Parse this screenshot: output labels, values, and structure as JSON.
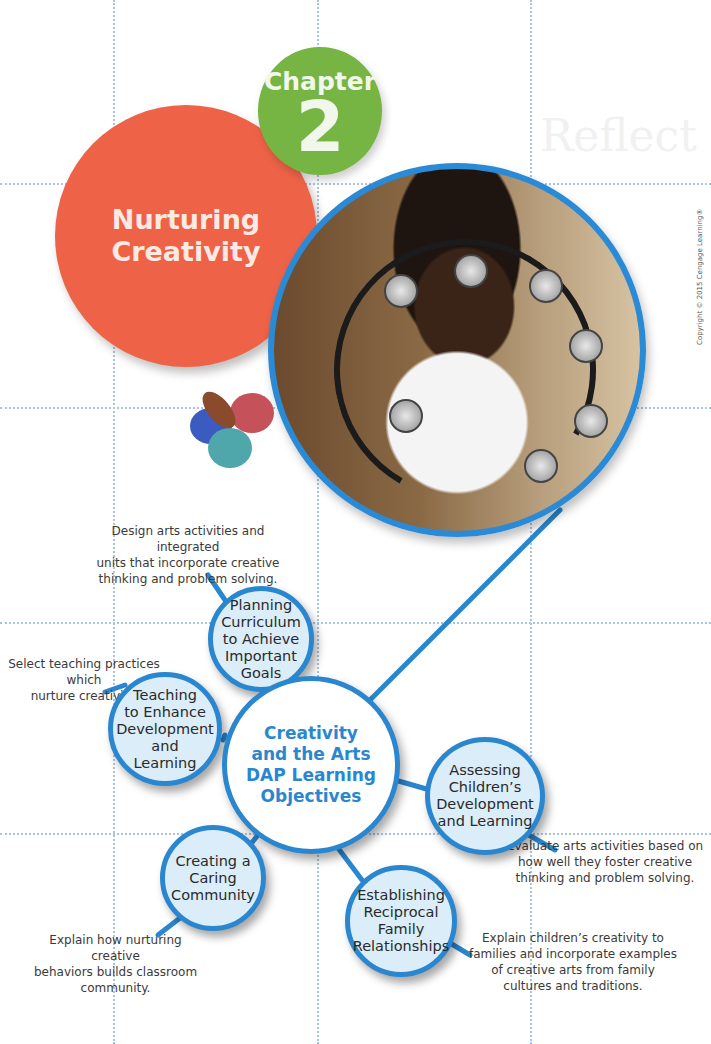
{
  "chapter": {
    "label": "Chapter",
    "number": "2",
    "title_line1": "Nurturing",
    "title_line2": "Creativity"
  },
  "photo": {
    "description": "Child holding a tambourine",
    "copyright": "Copyright © 2015 Cengage Learning®"
  },
  "background": {
    "faint_text": "Reflect"
  },
  "diagram": {
    "center": {
      "line1": "Creativity",
      "line2": "and the Arts",
      "line3": "DAP Learning",
      "line4": "Objectives"
    },
    "nodes": [
      {
        "lines": [
          "Planning",
          "Curriculum",
          "to Achieve",
          "Important",
          "Goals"
        ],
        "description": [
          "Design arts activities and integrated",
          "units that incorporate creative",
          "thinking and problem solving."
        ]
      },
      {
        "lines": [
          "Teaching",
          "to Enhance",
          "Development",
          "and",
          "Learning"
        ],
        "description": [
          "Select teaching practices which",
          "nurture creativity."
        ]
      },
      {
        "lines": [
          "Assessing",
          "Children’s",
          "Development",
          "and Learning"
        ],
        "description": [
          "Evaluate arts activities based on",
          "how well they foster creative",
          "thinking and problem solving."
        ]
      },
      {
        "lines": [
          "Creating a",
          "Caring",
          "Community"
        ],
        "description": [
          "Explain how nurturing creative",
          "behaviors builds classroom",
          "community."
        ]
      },
      {
        "lines": [
          "Establishing",
          "Reciprocal",
          "Family",
          "Relationships"
        ],
        "description": [
          "Explain children’s creativity to",
          "families and incorporate examples",
          "of creative arts from family",
          "cultures and traditions."
        ]
      }
    ]
  },
  "colors": {
    "accent_blue": "#2a87cf",
    "chapter_green": "#76b443",
    "title_red": "#ee6347",
    "node_fill": "#daedf9"
  }
}
